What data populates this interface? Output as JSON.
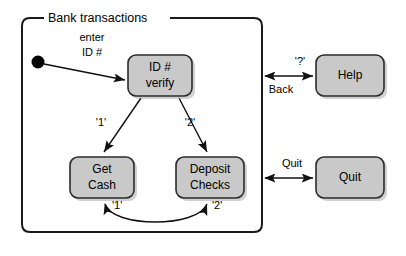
{
  "diagram": {
    "title": "Bank transactions",
    "kind": "statechart",
    "colors": {
      "state_fill": "#c9c9c9",
      "state_stroke": "#2b2b2b",
      "container_stroke": "#1a1a1a",
      "edge_stroke": "#111111",
      "background": "#ffffff",
      "text": "#000000"
    },
    "container": {
      "label": "Bank transactions",
      "x": 22,
      "y": 18,
      "width": 240,
      "height": 214
    },
    "initial_state": {
      "name": "initial-pseudostate",
      "cx": 38,
      "cy": 62,
      "r": 6
    },
    "states": [
      {
        "id": "id-verify",
        "line1": "ID #",
        "line2": "verify",
        "x": 128,
        "y": 55,
        "width": 64,
        "height": 41,
        "inside_container": true
      },
      {
        "id": "get-cash",
        "line1": "Get",
        "line2": "Cash",
        "x": 70,
        "y": 157,
        "width": 64,
        "height": 41,
        "inside_container": true
      },
      {
        "id": "deposit-checks",
        "line1": "Deposit",
        "line2": "Checks",
        "x": 176,
        "y": 157,
        "width": 68,
        "height": 41,
        "inside_container": true
      },
      {
        "id": "help",
        "line1": "Help",
        "line2": "",
        "x": 316,
        "y": 55,
        "width": 68,
        "height": 41,
        "inside_container": false
      },
      {
        "id": "quit",
        "line1": "Quit",
        "line2": "",
        "x": 316,
        "y": 157,
        "width": 68,
        "height": 41,
        "inside_container": false
      }
    ],
    "transitions": [
      {
        "id": "enter-id",
        "from": "initial-pseudostate",
        "to": "id-verify",
        "label_line1": "enter",
        "label_line2": "ID #",
        "label_x": 92,
        "label_y1": 38,
        "label_y2": 53,
        "arrow": "single"
      },
      {
        "id": "verify-to-get-cash",
        "from": "id-verify",
        "to": "get-cash",
        "label": "'1'",
        "label_x": 98,
        "label_y": 123,
        "arrow": "single"
      },
      {
        "id": "verify-to-deposit",
        "from": "id-verify",
        "to": "deposit-checks",
        "label": "'2'",
        "label_x": 186,
        "label_y": 123,
        "arrow": "single"
      },
      {
        "id": "get-cash-loop",
        "from": "deposit-checks",
        "to": "get-cash",
        "label": "'1'",
        "label_x": 116,
        "label_y": 207,
        "arrow": "double"
      },
      {
        "id": "deposit-loop",
        "from": "get-cash",
        "to": "deposit-checks",
        "label": "'2'",
        "label_x": 216,
        "label_y": 207,
        "arrow": "double"
      },
      {
        "id": "help-transition",
        "from": "bank-transactions",
        "to": "help",
        "label_top": "'?'",
        "label_bottom": "Back",
        "label_top_x": 300,
        "label_top_y": 62,
        "label_bottom_x": 278,
        "label_bottom_y": 89,
        "arrow": "double"
      },
      {
        "id": "quit-transition",
        "from": "bank-transactions",
        "to": "quit",
        "label_top": "Quit",
        "label_bottom": "",
        "label_top_x": 291,
        "label_top_y": 163,
        "arrow": "double"
      }
    ]
  }
}
